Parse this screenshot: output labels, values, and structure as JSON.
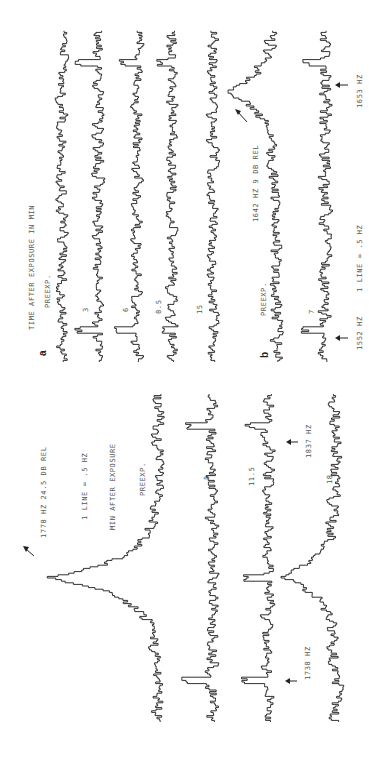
{
  "chart_data": [
    {
      "type": "line",
      "panel": "a",
      "title": "TIME AFTER EXPOSURE IN MIN",
      "xlabel": "frequency (1 LINE = .5 HZ)",
      "ylabel": "relative level",
      "series": [
        {
          "name": "PREEXP.",
          "peaks": []
        },
        {
          "name": "3",
          "peaks": [
            {
              "freq_hz": 1552,
              "height": 0.9
            },
            {
              "freq_hz": 1653,
              "height": 0.9
            }
          ]
        },
        {
          "name": "6",
          "peaks": [
            {
              "freq_hz": 1552,
              "height": 0.9
            },
            {
              "freq_hz": 1653,
              "height": 0.8
            }
          ]
        },
        {
          "name": "8.5",
          "peaks": [
            {
              "freq_hz": 1552,
              "height": 0.6
            },
            {
              "freq_hz": 1653,
              "height": 0.5
            }
          ]
        },
        {
          "name": "15",
          "peaks": []
        }
      ]
    },
    {
      "type": "line",
      "panel": "b",
      "xlabel": "1 LINE = .5 HZ",
      "annotations": [
        "1642 HZ 9 DB REL",
        "1552 HZ",
        "1653 HZ"
      ],
      "series": [
        {
          "name": "PREEXP.",
          "peaks": [
            {
              "freq_hz": 1642,
              "height": 2.5,
              "width": "broad"
            }
          ]
        },
        {
          "name": "7",
          "peaks": [
            {
              "freq_hz": 1552,
              "height": 0.9
            },
            {
              "freq_hz": 1653,
              "height": 0.9
            }
          ]
        }
      ]
    },
    {
      "type": "line",
      "panel": "c",
      "title": "MIN AFTER EXPOSURE",
      "xlabel": "1 LINE = .5 HZ",
      "annotations": [
        "1778 HZ 24.5 DB REL",
        "1738 HZ",
        "1837 HZ"
      ],
      "series": [
        {
          "name": "PREEXP.",
          "peaks": [
            {
              "freq_hz": 1778,
              "height": 5.0,
              "width": "broad"
            }
          ]
        },
        {
          "name": "5",
          "peaks": [
            {
              "freq_hz": 1738,
              "height": 1.2
            },
            {
              "freq_hz": 1837,
              "height": 1.2
            }
          ]
        },
        {
          "name": "11.5",
          "peaks": [
            {
              "freq_hz": 1738,
              "height": 1.0
            },
            {
              "freq_hz": 1778,
              "height": 1.0
            },
            {
              "freq_hz": 1837,
              "height": 0.8
            }
          ]
        },
        {
          "name": "18",
          "peaks": [
            {
              "freq_hz": 1778,
              "height": 2.6,
              "width": "broad"
            }
          ]
        }
      ]
    }
  ],
  "labels": {
    "panel_a": "a",
    "panel_b": "b",
    "a_title": "TIME AFTER EXPOSURE IN MIN",
    "a_preexp": "PREEXP.",
    "a_3": "3",
    "a_6": "6",
    "a_85": "8.5",
    "a_15": "15",
    "b_preexp": "PREEXP.",
    "b_7": "7",
    "b_peak": "1642 HZ 9 DB REL",
    "b_1552": "1552 HZ",
    "b_scale": "1 LINE = .5 HZ",
    "b_1653": "1653 HZ",
    "c_peak": "1778 HZ 24.5 DB REL",
    "c_scale": "1 LINE = .5 HZ",
    "c_title": "MIN AFTER EXPOSURE",
    "c_preexp": "PREEXP.",
    "c_5": "5",
    "c_115": "11.5",
    "c_18": "18",
    "c_1738": "1738 HZ",
    "c_1837": "1837 HZ"
  }
}
